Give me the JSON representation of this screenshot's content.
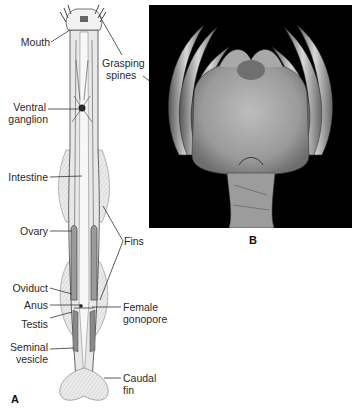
{
  "figure": {
    "panel_a": {
      "letter": "A",
      "subject": "arrow-worm-anatomy-drawing",
      "labels_left": {
        "mouth": "Mouth",
        "ventral_ganglion_1": "Ventral",
        "ventral_ganglion_2": "ganglion",
        "intestine": "Intestine",
        "ovary": "Ovary",
        "oviduct": "Oviduct",
        "anus": "Anus",
        "testis": "Testis",
        "seminal_vesicle_1": "Seminal",
        "seminal_vesicle_2": "vesicle"
      },
      "labels_right": {
        "grasping_spines_1": "Grasping",
        "grasping_spines_2": "spines",
        "fins": "Fins",
        "female_gonopore_1": "Female",
        "female_gonopore_2": "gonopore",
        "caudal_fin_1": "Caudal",
        "caudal_fin_2": "fin"
      }
    },
    "panel_b": {
      "letter": "B",
      "subject": "sem-micrograph-head-grasping-spines"
    },
    "colors": {
      "photo_background": "#000000",
      "line": "#333333",
      "body_fill": "#e6e6e6",
      "fin_fill": "#d9d9d9"
    }
  }
}
